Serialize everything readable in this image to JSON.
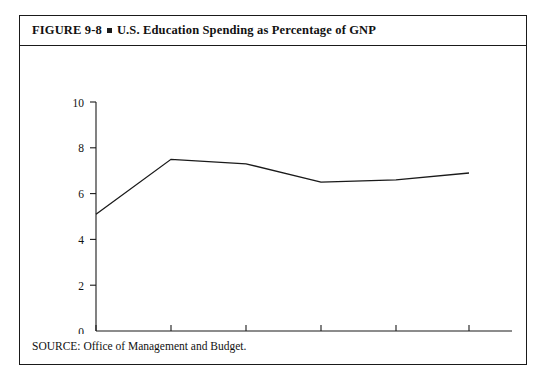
{
  "figure": {
    "label": "FIGURE 9-8",
    "separator": "square-bullet",
    "title": "U.S. Education Spending as Percentage of GNP",
    "source": "SOURCE: Office of Management and Budget."
  },
  "chart_data": {
    "type": "line",
    "title": "U.S. Education Spending as Percentage of GNP",
    "xlabel": "",
    "ylabel": "",
    "categories": [
      "1960",
      "1970",
      "1975",
      "1980",
      "1985",
      "1989"
    ],
    "values": [
      5.1,
      7.5,
      7.3,
      6.5,
      6.6,
      6.9
    ],
    "series": [
      {
        "name": "U.S. Education Spending as Percentage of GNP",
        "values": [
          5.1,
          7.5,
          7.3,
          6.5,
          6.6,
          6.9
        ]
      }
    ],
    "ylim": [
      0,
      10
    ],
    "yticks": [
      0,
      2,
      4,
      6,
      8,
      10
    ],
    "ytick_labels": [
      "0",
      "2",
      "4",
      "6",
      "8",
      "10"
    ],
    "xtick_labels": [
      "1960",
      "1970",
      "1975",
      "1980",
      "1985",
      "1989"
    ],
    "grid": false,
    "legend": false,
    "line_color": "#1a1a1a",
    "axis_color": "#1a1a1a"
  }
}
